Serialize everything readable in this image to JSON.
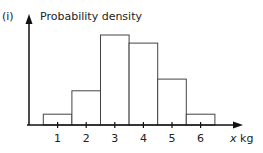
{
  "part_label": "(i)",
  "chart_data": {
    "type": "bar",
    "title": "",
    "ylabel": "Probability density",
    "xlabel": "x kg",
    "x_ticks": [
      "1",
      "2",
      "3",
      "4",
      "5",
      "6"
    ],
    "bins": [
      [
        0.5,
        1.5
      ],
      [
        1.5,
        2.5
      ],
      [
        2.5,
        3.5
      ],
      [
        3.5,
        4.5
      ],
      [
        4.5,
        5.5
      ],
      [
        5.5,
        6.5
      ]
    ],
    "categories": [
      "0.5-1.5",
      "1.5-2.5",
      "2.5-3.5",
      "3.5-4.5",
      "4.5-5.5",
      "5.5-6.5"
    ],
    "values": [
      0.12,
      0.38,
      1.0,
      0.91,
      0.51,
      0.12
    ],
    "y_axis_scale": "unlabelled (relative heights)",
    "grid": false,
    "legend": null
  }
}
